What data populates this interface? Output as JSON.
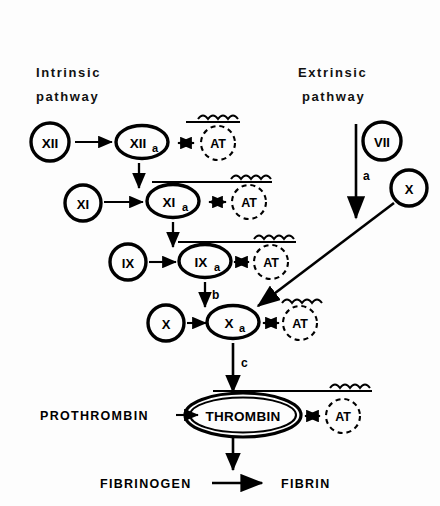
{
  "figure": {
    "background": "#fdfdfd",
    "ink": "#000000"
  },
  "headers": {
    "intrinsic": "Intrinsic\npathway",
    "intrinsic_line1": "Intrinsic",
    "intrinsic_line2": "pathway",
    "extrinsic_line1": "Extrinsic",
    "extrinsic_line2": "pathway"
  },
  "nodes": {
    "f12": {
      "label": "XII",
      "sub": "",
      "shape": "circle",
      "x": 50,
      "y": 142
    },
    "f12a": {
      "label": "XII",
      "sub": "a",
      "shape": "ellipse",
      "x": 142,
      "y": 142
    },
    "at1": {
      "label": "AT",
      "sub": "",
      "shape": "dashed-circle",
      "x": 218,
      "y": 143
    },
    "f11": {
      "label": "XI",
      "sub": "",
      "shape": "circle",
      "x": 83,
      "y": 203
    },
    "f11a": {
      "label": "XI",
      "sub": "a",
      "shape": "ellipse",
      "x": 173,
      "y": 201
    },
    "at2": {
      "label": "AT",
      "sub": "",
      "shape": "dashed-circle",
      "x": 249,
      "y": 202
    },
    "f9": {
      "label": "IX",
      "sub": "",
      "shape": "circle",
      "x": 128,
      "y": 262
    },
    "f9a": {
      "label": "IX",
      "sub": "a",
      "shape": "ellipse",
      "x": 205,
      "y": 261
    },
    "at3": {
      "label": "AT",
      "sub": "",
      "shape": "dashed-circle",
      "x": 271,
      "y": 262
    },
    "f10": {
      "label": "X",
      "sub": "",
      "shape": "circle",
      "x": 166,
      "y": 323
    },
    "f10a": {
      "label": "X",
      "sub": "a",
      "shape": "ellipse",
      "x": 233,
      "y": 322
    },
    "at4": {
      "label": "AT",
      "sub": "",
      "shape": "dashed-circle",
      "x": 300,
      "y": 323
    },
    "f7": {
      "label": "VII",
      "sub": "",
      "shape": "circle",
      "x": 382,
      "y": 141
    },
    "f10x": {
      "label": "X",
      "sub": "",
      "shape": "circle",
      "x": 409,
      "y": 188
    },
    "thrombin": {
      "label": "THROMBIN",
      "sub": "",
      "shape": "double-ellipse",
      "x": 243,
      "y": 415
    },
    "at5": {
      "label": "AT",
      "sub": "",
      "shape": "dashed-circle",
      "x": 343,
      "y": 416
    }
  },
  "plain_labels": {
    "prothrombin": "PROTHROMBIN",
    "fibrinogen": "FIBRINOGEN",
    "fibrin": "FIBRIN"
  },
  "step_labels": {
    "a": "a",
    "b": "b",
    "c": "c"
  },
  "arrow_symbols": {
    "double_head": "↔",
    "right": "→",
    "down": "↓"
  },
  "reactions": [
    {
      "from": "XII",
      "to": "XIIa",
      "type": "activation"
    },
    {
      "from": "XIIa",
      "to": "AT",
      "type": "inhibition"
    },
    {
      "from": "XIIa",
      "to": "XIa",
      "type": "activation"
    },
    {
      "from": "XI",
      "to": "XIa",
      "type": "activation"
    },
    {
      "from": "XIa",
      "to": "AT",
      "type": "inhibition"
    },
    {
      "from": "XIa",
      "to": "IXa",
      "type": "activation"
    },
    {
      "from": "IX",
      "to": "IXa",
      "type": "activation"
    },
    {
      "from": "IXa",
      "to": "AT",
      "type": "inhibition"
    },
    {
      "from": "IXa",
      "to": "Xa",
      "type": "activation",
      "label": "b"
    },
    {
      "from": "X",
      "to": "Xa",
      "type": "activation"
    },
    {
      "from": "Xa",
      "to": "AT",
      "type": "inhibition"
    },
    {
      "from": "VII",
      "to": "Xa",
      "type": "activation",
      "label": "a"
    },
    {
      "from": "X(extrinsic)",
      "to": "Xa",
      "type": "activation"
    },
    {
      "from": "Xa",
      "to": "THROMBIN",
      "type": "activation",
      "label": "c"
    },
    {
      "from": "PROTHROMBIN",
      "to": "THROMBIN",
      "type": "activation"
    },
    {
      "from": "THROMBIN",
      "to": "AT",
      "type": "inhibition"
    },
    {
      "from": "THROMBIN",
      "to": "FIBRIN",
      "type": "activation"
    },
    {
      "from": "FIBRINOGEN",
      "to": "FIBRIN",
      "type": "activation"
    }
  ]
}
